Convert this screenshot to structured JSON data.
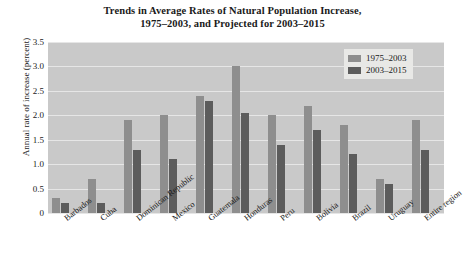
{
  "chart_data": {
    "type": "bar",
    "title": "Trends in Average Rates of Natural Population Increase, 1975–2003, and Projected for 2003–2015",
    "title_line1": "Trends in Average Rates of Natural Population Increase,",
    "title_line2": "1975–2003, and Projected for 2003–2015",
    "xlabel": "",
    "ylabel": "Annual rate of increase (percent)",
    "ylim": [
      0,
      3.5
    ],
    "ytick_labels": [
      "3.5",
      "3.0",
      "2.5",
      "2.0",
      "1.5",
      "1.0",
      "0.5",
      "0"
    ],
    "ytick_values": [
      3.5,
      3.0,
      2.5,
      2.0,
      1.5,
      1.0,
      0.5,
      0
    ],
    "grid": true,
    "legend_position": "top-right",
    "categories": [
      "Barbados",
      "Cuba",
      "Dominican Republic",
      "Mexico",
      "Guatemala",
      "Honduras",
      "Peru",
      "Bolivia",
      "Brazil",
      "Uruguay",
      "Entire region"
    ],
    "series": [
      {
        "name": "1975–2003",
        "color": "#8e8e8e",
        "values": [
          0.3,
          0.7,
          1.9,
          2.0,
          2.4,
          3.0,
          2.0,
          2.2,
          1.8,
          0.7,
          1.9
        ]
      },
      {
        "name": "2003–2015",
        "color": "#5c5c5c",
        "values": [
          0.2,
          0.2,
          1.3,
          1.1,
          2.3,
          2.05,
          1.4,
          1.7,
          1.2,
          0.6,
          1.3
        ]
      }
    ],
    "plot_background": "#c9c9c9",
    "gridline_color": "#e6e6e6"
  }
}
